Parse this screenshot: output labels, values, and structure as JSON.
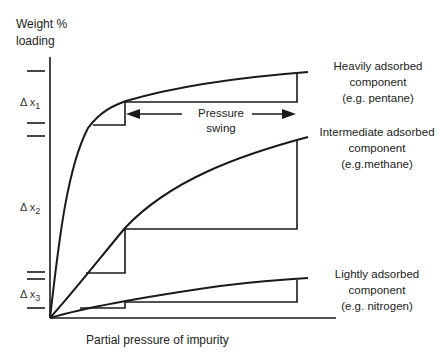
{
  "diagram": {
    "y_axis_label_line1": "Weight %",
    "y_axis_label_line2": "loading",
    "x_axis_label": "Partial pressure of impurity",
    "pressure_swing_line1": "Pressure",
    "pressure_swing_line2": "swing",
    "deltas": [
      {
        "symbol": "Δ x",
        "index": "1"
      },
      {
        "symbol": "Δ x",
        "index": "2"
      },
      {
        "symbol": "Δ x",
        "index": "3"
      }
    ],
    "curves": [
      {
        "id": "heavy",
        "line1": "Heavily adsorbed",
        "line2": "component",
        "line3": "(e.g. pentane)"
      },
      {
        "id": "intermediate",
        "line1": "Intermediate adsorbed",
        "line2": "component",
        "line3": "(e.g.methane)"
      },
      {
        "id": "light",
        "line1": "Lightly adsorbed",
        "line2": "component",
        "line3": "(e.g. nitrogen)"
      }
    ],
    "line_color": "#1a1a1a"
  }
}
